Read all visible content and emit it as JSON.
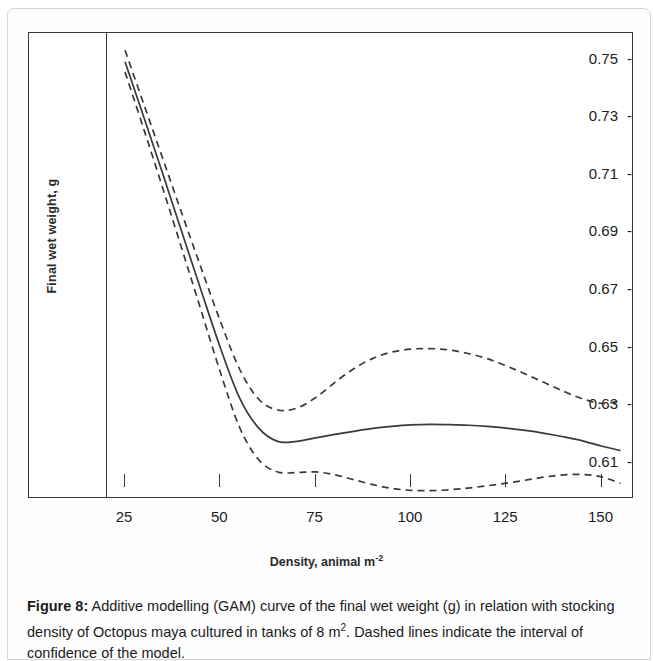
{
  "figure": {
    "caption_label": "Figure 8:",
    "caption_text": " Additive modelling (GAM) curve of the final wet weight (g) in relation with stocking density of Octopus maya cultured in tanks of 8 m",
    "caption_superscript": "2",
    "caption_text_end": ". Dashed lines indicate the interval of confidence of the model."
  },
  "axes": {
    "y_title": "Final wet  weight, g",
    "x_title_main": "Density, animal m",
    "x_title_sup": "-2",
    "tick_dash": "-"
  },
  "chart_data": {
    "type": "line",
    "title": "",
    "xlabel": "Density, animal m-2",
    "ylabel": "Final wet weight, g",
    "xlim": [
      20,
      158
    ],
    "ylim": [
      0.5975,
      0.7585
    ],
    "grid": false,
    "legend": false,
    "xticks": [
      25,
      50,
      75,
      100,
      125,
      150
    ],
    "xticklabels": [
      "25",
      "50",
      "75",
      "100",
      "125",
      "150"
    ],
    "yticks": [
      0.75,
      0.73,
      0.71,
      0.69,
      0.67,
      0.65,
      0.63,
      0.61
    ],
    "yticklabels": [
      "0.75",
      "0.73",
      "0.71",
      "0.69",
      "0.67",
      "0.65",
      "0.63",
      "0.61"
    ],
    "x": [
      25,
      30,
      35,
      40,
      45,
      50,
      55,
      60,
      65,
      70,
      75,
      80,
      85,
      90,
      95,
      100,
      105,
      110,
      115,
      120,
      125,
      130,
      135,
      140,
      145,
      150,
      155
    ],
    "series": [
      {
        "name": "GAM fitted curve",
        "style": "solid",
        "values": [
          0.7485,
          0.729,
          0.7092,
          0.689,
          0.669,
          0.6493,
          0.632,
          0.6215,
          0.6168,
          0.6168,
          0.618,
          0.6192,
          0.6203,
          0.6213,
          0.622,
          0.6225,
          0.6227,
          0.6226,
          0.6224,
          0.622,
          0.6214,
          0.6206,
          0.6196,
          0.6184,
          0.617,
          0.6152,
          0.6136
        ]
      },
      {
        "name": "Upper confidence interval",
        "style": "dashed",
        "values": [
          0.7525,
          0.7335,
          0.7145,
          0.6955,
          0.6768,
          0.6585,
          0.642,
          0.6315,
          0.6277,
          0.6283,
          0.632,
          0.6372,
          0.642,
          0.6456,
          0.6478,
          0.6488,
          0.649,
          0.6485,
          0.6473,
          0.6455,
          0.643,
          0.6402,
          0.6372,
          0.6342,
          0.6316,
          0.63,
          0.6308
        ]
      },
      {
        "name": "Lower confidence interval",
        "style": "dashed",
        "values": [
          0.745,
          0.7248,
          0.7042,
          0.6832,
          0.662,
          0.6408,
          0.6218,
          0.6105,
          0.6062,
          0.606,
          0.6062,
          0.6052,
          0.6035,
          0.6018,
          0.6005,
          0.5998,
          0.5997,
          0.6,
          0.6006,
          0.6014,
          0.6023,
          0.6033,
          0.6044,
          0.6052,
          0.6053,
          0.6045,
          0.6022
        ]
      }
    ]
  }
}
